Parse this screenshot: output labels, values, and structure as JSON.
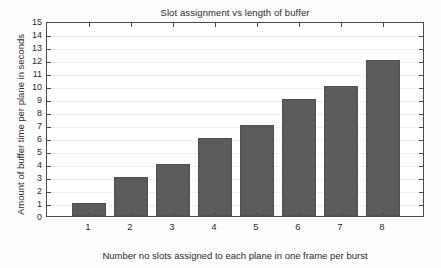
{
  "chart_data": {
    "type": "bar",
    "title": "Slot assignment vs length of buffer",
    "xlabel": "Number no slots assigned to each plane in one frame per burst",
    "ylabel": "Amount of buffer time per plane in seconds",
    "categories": [
      "1",
      "2",
      "3",
      "4",
      "5",
      "6",
      "7",
      "8"
    ],
    "values": [
      1,
      3,
      4,
      6,
      7,
      9,
      10,
      12
    ],
    "ylim": [
      0,
      15
    ],
    "ytick_labels": [
      "0",
      "1",
      "2",
      "3",
      "4",
      "5",
      "6",
      "7",
      "8",
      "9",
      "10",
      "11",
      "12",
      "13",
      "14",
      "15"
    ],
    "ytick_step": 1,
    "xlim": [
      0,
      9
    ],
    "grid": true,
    "legend": "none",
    "bar_color": "#5b5b5b",
    "axis_color": "#4a4a4a",
    "grid_color": "#efefef",
    "background": "#ffffff"
  }
}
